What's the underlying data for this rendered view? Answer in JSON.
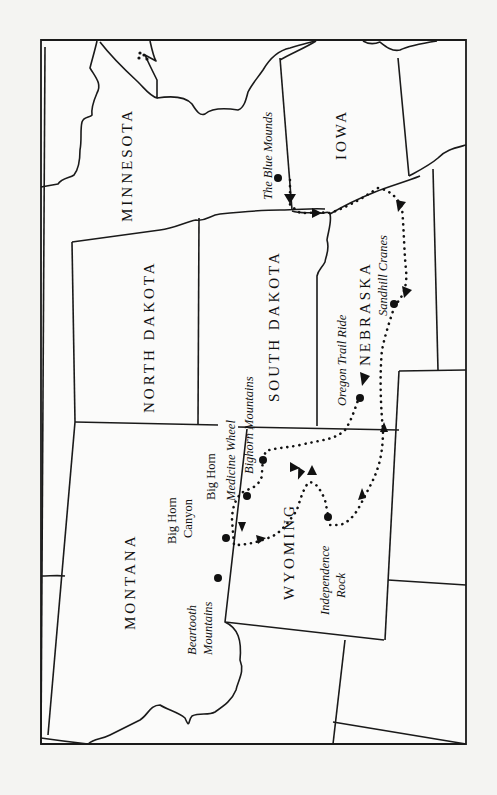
{
  "map": {
    "orientation": "rotated 90 degrees counter-clockwise (north at left)",
    "states": [
      {
        "id": "minnesota",
        "label": "MINNESOTA"
      },
      {
        "id": "iowa",
        "label": "IOWA"
      },
      {
        "id": "north-dakota",
        "label": "NORTH DAKOTA"
      },
      {
        "id": "south-dakota",
        "label": "SOUTH DAKOTA"
      },
      {
        "id": "nebraska",
        "label": "NEBRASKA"
      },
      {
        "id": "montana",
        "label": "MONTANA"
      },
      {
        "id": "wyoming",
        "label": "WYOMING"
      }
    ],
    "places": [
      {
        "id": "blue-mounds",
        "label": "The Blue Mounds"
      },
      {
        "id": "sandhill-cranes",
        "label": "Sandhill Cranes"
      },
      {
        "id": "oregon-trail-ride",
        "label": "Oregon Trail Ride"
      },
      {
        "id": "bighorn-mountains",
        "label": "Bighorn Mountains"
      },
      {
        "id": "medicine-wheel",
        "label": "Medicine Wheel"
      },
      {
        "id": "big-horn-1",
        "label": "Big Horn"
      },
      {
        "id": "big-horn-canyon-line1",
        "label": "Big Horn"
      },
      {
        "id": "big-horn-canyon-line2",
        "label": "Canyon"
      },
      {
        "id": "beartooth-line1",
        "label": "Beartooth"
      },
      {
        "id": "beartooth-line2",
        "label": "Mountains"
      },
      {
        "id": "independence-line1",
        "label": "Independence"
      },
      {
        "id": "independence-line2",
        "label": "Rock"
      }
    ],
    "colors": {
      "background": "#f4f4f2",
      "land": "#fbfbfa",
      "ink": "#111111"
    }
  }
}
